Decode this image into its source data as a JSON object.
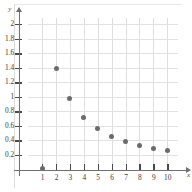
{
  "chart_data": {
    "type": "scatter",
    "title": "",
    "xlabel": "x",
    "ylabel": "y",
    "xlim": [
      0,
      10.8
    ],
    "ylim": [
      0,
      2.15
    ],
    "grid": true,
    "legend": null,
    "x": [
      1,
      2,
      3,
      4,
      5,
      6,
      7,
      8,
      9,
      10
    ],
    "values": [
      0.02,
      1.39,
      0.97,
      0.72,
      0.56,
      0.45,
      0.385,
      0.335,
      0.295,
      0.26
    ],
    "series": [
      {
        "name": "series-1",
        "values": [
          0.02,
          1.39,
          0.97,
          0.72,
          0.56,
          0.45,
          0.385,
          0.335,
          0.295,
          0.26
        ]
      }
    ],
    "x_tick_labels": [
      "1",
      "2",
      "3",
      "4",
      "5",
      "6",
      "7",
      "8",
      "9",
      "10"
    ],
    "y_tick_labels": [
      "0.2",
      "0.4",
      "0.6",
      "0.8",
      "1",
      "1.2",
      "1.4",
      "1.6",
      "1.8",
      "2"
    ],
    "y_tick_values": [
      0.2,
      0.4,
      0.6,
      0.8,
      1.0,
      1.2,
      1.4,
      1.6,
      1.8,
      2.0
    ],
    "marker_color": "#6b6b6b",
    "axis_color": "#6f6f6f",
    "grid_color": "#dedede"
  }
}
